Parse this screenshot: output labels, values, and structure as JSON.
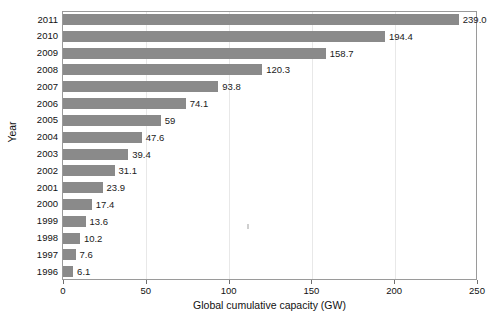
{
  "chart_data": {
    "type": "bar",
    "orientation": "horizontal",
    "title": "",
    "xlabel": "Global cumulative capacity (GW)",
    "ylabel": "Year",
    "categories": [
      "2011",
      "2010",
      "2009",
      "2008",
      "2007",
      "2006",
      "2005",
      "2004",
      "2003",
      "2002",
      "2001",
      "2000",
      "1999",
      "1998",
      "1997",
      "1996"
    ],
    "values": [
      239.0,
      194.4,
      158.7,
      120.3,
      93.8,
      74.1,
      59,
      47.6,
      39.4,
      31.1,
      23.9,
      17.4,
      13.6,
      10.2,
      7.6,
      6.1
    ],
    "value_labels": [
      "239.0",
      "194.4",
      "158.7",
      "120.3",
      "93.8",
      "74.1",
      "59",
      "47.6",
      "39.4",
      "31.1",
      "23.9",
      "17.4",
      "13.6",
      "10.2",
      "7.6",
      "6.1"
    ],
    "xlim": [
      0,
      250
    ],
    "xticks": [
      0,
      50,
      100,
      150,
      200,
      250
    ],
    "xtick_labels": [
      "0",
      "50",
      "100",
      "150",
      "200",
      "250"
    ],
    "grid": "vertical-minor",
    "legend": "none",
    "bar_color": "#8a8a8a",
    "frame_color": "#9a9a9a",
    "gridline_color": "#e8e8e8",
    "text_color": "#1a1a1a"
  }
}
